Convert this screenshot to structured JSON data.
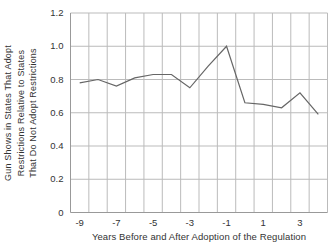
{
  "chart_data": {
    "type": "line",
    "title": "",
    "xlabel": "Years Before and After Adoption of the Regulation",
    "ylabel_lines": [
      "Gun Shows in States That Adopt",
      "Restrictions Relative to States",
      "That Do Not Adopt Restrictions"
    ],
    "x": [
      -9,
      -8,
      -7,
      -6,
      -5,
      -4,
      -3,
      -2,
      -1,
      0,
      1,
      2,
      3,
      4
    ],
    "values": [
      0.78,
      0.8,
      0.76,
      0.81,
      0.83,
      0.83,
      0.75,
      0.88,
      1.0,
      0.66,
      0.65,
      0.63,
      0.72,
      0.59
    ],
    "ylim": [
      0,
      1.2
    ],
    "yticks": [
      0,
      0.2,
      0.4,
      0.6,
      0.8,
      1.0,
      1.2
    ],
    "ytick_labels": [
      "0",
      "0.2",
      "0.4",
      "0.6",
      "0.8",
      "1.0",
      "1.2"
    ],
    "xticks": [
      -9,
      -7,
      -5,
      -3,
      -1,
      1,
      3
    ],
    "xtick_labels": [
      "-9",
      "-7",
      "-5",
      "-3",
      "-1",
      "1",
      "3"
    ],
    "grid": true,
    "tick_between_categories": true,
    "legend": "none",
    "colors": {
      "line": "#666666",
      "grid": "#bbbbbb",
      "axis": "#999999",
      "text": "#333333",
      "background": "#ffffff"
    }
  }
}
